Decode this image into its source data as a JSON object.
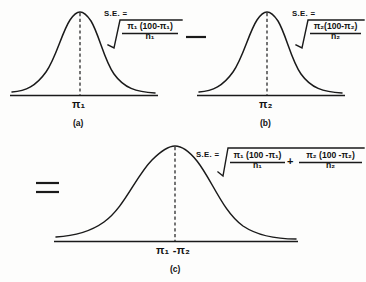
{
  "figure": {
    "background_color": "#fdfdfc",
    "ink_color": "#1a1a1a"
  },
  "operators": {
    "minus": "−",
    "equals": "=",
    "plus": "+",
    "equals_sign_in_formula": "=",
    "radical": "√"
  },
  "panels": [
    {
      "id": "a",
      "caption": "(a)",
      "axis_label": "π₁",
      "axis_label_base": "π",
      "axis_label_sub": "1",
      "se_prefix": "S.E. =",
      "formula_terms": [
        {
          "numerator": "π₁ (100-π₁)",
          "numerator_base": "π",
          "numerator_sub": "1",
          "denominator": "n₁",
          "denominator_base": "n",
          "denominator_sub": "1"
        }
      ]
    },
    {
      "id": "b",
      "caption": "(b)",
      "axis_label": "π₂",
      "axis_label_base": "π",
      "axis_label_sub": "2",
      "se_prefix": "S.E. =",
      "formula_terms": [
        {
          "numerator": "π₂(100-π₂)",
          "numerator_base": "π",
          "numerator_sub": "2",
          "denominator": "n₂",
          "denominator_base": "n",
          "denominator_sub": "2"
        }
      ]
    },
    {
      "id": "c",
      "caption": "(c)",
      "axis_label": "π₁ -π₂",
      "axis_label_base": "π",
      "axis_label_sub": "1",
      "axis_label_base2": "π",
      "axis_label_sub2": "2",
      "se_prefix": "S.E. =",
      "formula_terms": [
        {
          "numerator": "π₁ (100 -π₁)",
          "numerator_base": "π",
          "numerator_sub": "1",
          "denominator": "n₁",
          "denominator_base": "n",
          "denominator_sub": "1"
        },
        {
          "numerator": "π₂ (100 -π₂)",
          "numerator_base": "π",
          "numerator_sub": "2",
          "denominator": "n₂",
          "denominator_base": "n",
          "denominator_sub": "2"
        }
      ]
    }
  ]
}
